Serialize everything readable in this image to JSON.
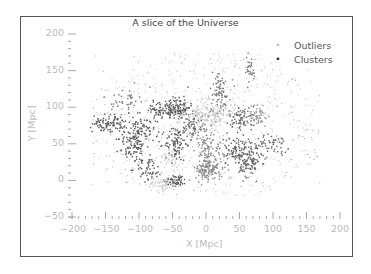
{
  "chart_data": {
    "type": "scatter",
    "title": "A slice of the Universe",
    "xlabel": "X [Mpc]",
    "ylabel": "Y [Mpc]",
    "xlim": [
      -200,
      200
    ],
    "ylim": [
      -50,
      200
    ],
    "xticks": [
      -200,
      -150,
      -100,
      -50,
      0,
      50,
      100,
      150,
      200
    ],
    "xtick_labels": [
      "−200",
      "−150",
      "−100",
      "−50",
      "0",
      "50",
      "100",
      "150",
      "200"
    ],
    "yticks": [
      200,
      150,
      100,
      50,
      0,
      -50
    ],
    "ytick_labels": [
      "200",
      "150",
      "100",
      "50",
      "0",
      "−50"
    ],
    "grid": false,
    "legend_position": "upper right",
    "legend": [
      {
        "label": "Outliers",
        "marker": "small dot",
        "color": "#bbbbbb"
      },
      {
        "label": "Clusters",
        "marker": "dot",
        "color": "#333333"
      }
    ],
    "series": [
      {
        "name": "Outliers",
        "color": "#bbbbbb",
        "description": "Sparse scattered points spanning roughly X -170..170, Y -20..175",
        "region": {
          "x": [
            -170,
            170
          ],
          "y": [
            -20,
            175
          ]
        },
        "count": 700
      },
      {
        "name": "Clusters",
        "color": "#666666",
        "description": "Filamentary clusters (gray shades); central light-gray concentration near (0,90)",
        "groups": [
          {
            "cx": -145,
            "cy": 78,
            "sx": 12,
            "sy": 6,
            "n": 90,
            "shade": "#555555"
          },
          {
            "cx": -100,
            "cy": 65,
            "sx": 12,
            "sy": 10,
            "n": 90,
            "shade": "#555555"
          },
          {
            "cx": -60,
            "cy": 95,
            "sx": 18,
            "sy": 6,
            "n": 110,
            "shade": "#555555"
          },
          {
            "cx": -40,
            "cy": 100,
            "sx": 8,
            "sy": 8,
            "n": 80,
            "shade": "#555555"
          },
          {
            "cx": -45,
            "cy": 50,
            "sx": 8,
            "sy": 12,
            "n": 90,
            "shade": "#555555"
          },
          {
            "cx": -110,
            "cy": 45,
            "sx": 10,
            "sy": 10,
            "n": 70,
            "shade": "#555555"
          },
          {
            "cx": -85,
            "cy": 15,
            "sx": 10,
            "sy": 8,
            "n": 50,
            "shade": "#555555"
          },
          {
            "cx": -45,
            "cy": 0,
            "sx": 8,
            "sy": 4,
            "n": 60,
            "shade": "#555555"
          },
          {
            "cx": 0,
            "cy": 90,
            "sx": 22,
            "sy": 9,
            "n": 220,
            "shade": "#cccccc"
          },
          {
            "cx": -65,
            "cy": -5,
            "sx": 12,
            "sy": 5,
            "n": 70,
            "shade": "#d0d0d0"
          },
          {
            "cx": -55,
            "cy": 30,
            "sx": 8,
            "sy": 8,
            "n": 40,
            "shade": "#d0d0d0"
          },
          {
            "cx": 5,
            "cy": 15,
            "sx": 10,
            "sy": 8,
            "n": 130,
            "shade": "#888888"
          },
          {
            "cx": 0,
            "cy": 45,
            "sx": 6,
            "sy": 18,
            "n": 90,
            "shade": "#888888"
          },
          {
            "cx": 50,
            "cy": 40,
            "sx": 16,
            "sy": 10,
            "n": 150,
            "shade": "#666666"
          },
          {
            "cx": 65,
            "cy": 20,
            "sx": 8,
            "sy": 8,
            "n": 70,
            "shade": "#666666"
          },
          {
            "cx": 55,
            "cy": 85,
            "sx": 10,
            "sy": 8,
            "n": 80,
            "shade": "#666666"
          },
          {
            "cx": 20,
            "cy": 120,
            "sx": 8,
            "sy": 15,
            "n": 80,
            "shade": "#777777"
          },
          {
            "cx": 65,
            "cy": 150,
            "sx": 5,
            "sy": 10,
            "n": 30,
            "shade": "#777777"
          },
          {
            "cx": 100,
            "cy": 50,
            "sx": 12,
            "sy": 6,
            "n": 50,
            "shade": "#666666"
          },
          {
            "cx": 80,
            "cy": 90,
            "sx": 8,
            "sy": 8,
            "n": 40,
            "shade": "#999999"
          },
          {
            "cx": -20,
            "cy": 70,
            "sx": 8,
            "sy": 10,
            "n": 60,
            "shade": "#666666"
          },
          {
            "cx": -120,
            "cy": 110,
            "sx": 10,
            "sy": 8,
            "n": 40,
            "shade": "#777777"
          }
        ]
      }
    ]
  }
}
